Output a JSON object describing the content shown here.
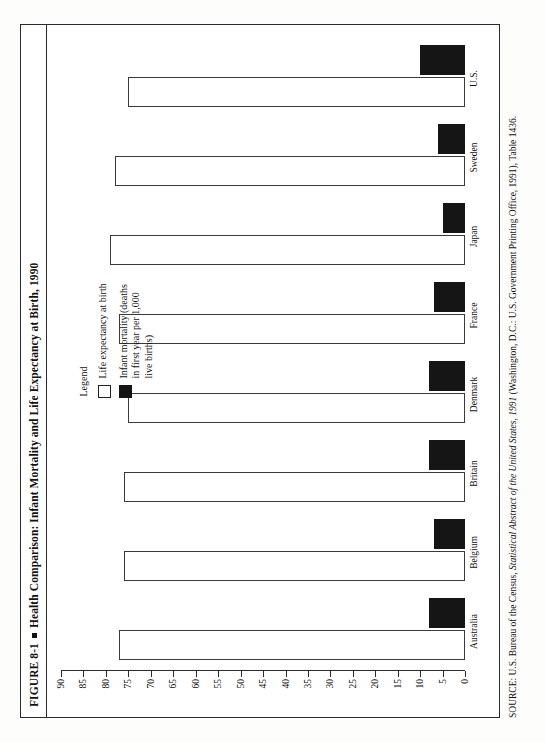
{
  "figure": {
    "label": "FIGURE 8-1",
    "bullet": "▪",
    "title": "Health Comparison: Infant Mortality and Life Expectancy at Birth, 1990",
    "full_title": "FIGURE 8-1 ▪ Health Comparison: Infant Mortality and Life Expectancy at Birth, 1990"
  },
  "legend": {
    "heading": "Legend",
    "items": [
      {
        "label": "Life expectancy at birth",
        "swatch": "white",
        "color": "#ffffff"
      },
      {
        "label": "Infant mortality (deaths\nin first year per 1,000\nlive births)",
        "swatch": "black",
        "color": "#151515"
      }
    ]
  },
  "source": {
    "prefix": "SOURCE: U.S. Bureau of the Census, ",
    "italic": "Statistical Abstract of the United States, 1991",
    "suffix": " (Washington, D.C.: U.S. Government Printing Office, 1991), Table 1436.",
    "full": "SOURCE: U.S. Bureau of the Census, Statistical Abstract of the United States, 1991 (Washington, D.C.: U.S. Government Printing Office, 1991), Table 1436."
  },
  "chart_data": {
    "type": "bar",
    "orientation": "horizontal",
    "title": "Health Comparison: Infant Mortality and Life Expectancy at Birth, 1990",
    "xlabel": "",
    "ylabel": "",
    "grid": false,
    "legend_position": "top-left",
    "axis_ticks": [
      0,
      5,
      10,
      15,
      20,
      25,
      30,
      35,
      40,
      45,
      50,
      55,
      60,
      65,
      70,
      75,
      80,
      85,
      90
    ],
    "axis_tick_labels": [
      "0",
      "5",
      "10",
      "15",
      "20",
      "25",
      "30",
      "35",
      "40",
      "45",
      "50",
      "55",
      "60",
      "65",
      "70",
      "75",
      "80",
      "85",
      "90"
    ],
    "xlim": [
      0,
      90
    ],
    "categories": [
      "Australia",
      "Belgium",
      "Britain",
      "Denmark",
      "France",
      "Japan",
      "Sweden",
      "U.S."
    ],
    "series": [
      {
        "name": "Life expectancy at birth",
        "color": "#ffffff",
        "values": [
          77,
          76,
          76,
          75,
          77,
          79,
          78,
          75
        ]
      },
      {
        "name": "Infant mortality (deaths in first year per 1,000 live births)",
        "color": "#151515",
        "values": [
          8,
          7,
          8,
          8,
          7,
          5,
          6,
          10
        ]
      }
    ]
  }
}
